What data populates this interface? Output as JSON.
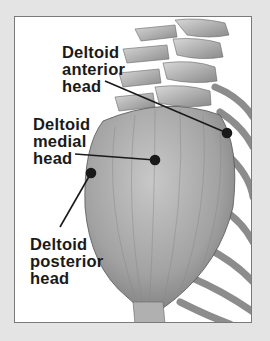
{
  "figure": {
    "colors": {
      "background": "#e4e4e4",
      "panel": "#ffffff",
      "muscle": "#a8a8a8",
      "text": "#1a1a1a"
    },
    "labels": [
      {
        "id": "anterior",
        "lines": [
          "Deltoid",
          "anterior",
          "head"
        ]
      },
      {
        "id": "medial",
        "lines": [
          "Deltoid",
          "medial",
          "head"
        ]
      },
      {
        "id": "posterior",
        "lines": [
          "Deltoid",
          "posterior",
          "head"
        ]
      }
    ]
  }
}
